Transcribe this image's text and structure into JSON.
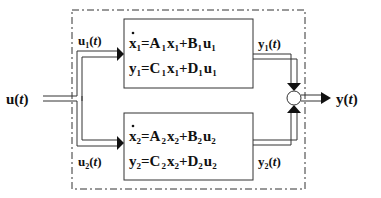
{
  "diagram": {
    "input_label": "u(t)",
    "input_var": "u",
    "input_arg": "t",
    "output_var": "y",
    "output_arg": "t",
    "branch_top": {
      "var": "u",
      "sub": "1",
      "arg": "t"
    },
    "branch_bottom": {
      "var": "u",
      "sub": "2",
      "arg": "t"
    },
    "out_top": {
      "var": "y",
      "sub": "1",
      "arg": "t"
    },
    "out_bottom": {
      "var": "y",
      "sub": "2",
      "arg": "t"
    },
    "block_top": {
      "eq1": {
        "lhs": "x",
        "lsub": "1",
        "a": "A",
        "asub": "1",
        "x": "x",
        "xsub": "1",
        "b": "B",
        "bsub": "1",
        "u": "u",
        "usub": "1"
      },
      "eq2": {
        "lhs": "y",
        "lsub": "1",
        "a": "C",
        "asub": "1",
        "x": "x",
        "xsub": "1",
        "b": "D",
        "bsub": "1",
        "u": "u",
        "usub": "1"
      }
    },
    "block_bottom": {
      "eq1": {
        "lhs": "x",
        "lsub": "2",
        "a": "A",
        "asub": "2",
        "x": "x",
        "xsub": "2",
        "b": "B",
        "bsub": "2",
        "u": "u",
        "usub": "2"
      },
      "eq2": {
        "lhs": "y",
        "lsub": "2",
        "a": "C",
        "asub": "2",
        "x": "x",
        "xsub": "2",
        "b": "D",
        "bsub": "2",
        "u": "u",
        "usub": "2"
      }
    },
    "eq_sign": "=",
    "plus_sign": "+",
    "paren_open": "(",
    "paren_close": ")"
  }
}
